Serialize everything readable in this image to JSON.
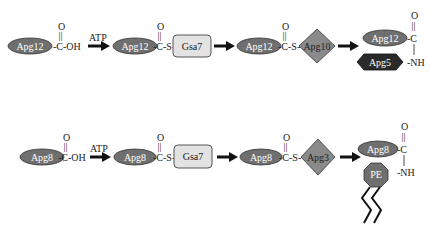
{
  "colors": {
    "ellipse_fill": "#6f6f6f",
    "diamond_fill": "#8a8a8a",
    "hexagon_fill": "#2a2a2a",
    "octagon_fill": "#6f6f6f",
    "box_fill": "#e3e3e3",
    "arrow": "#111111"
  },
  "rows": [
    {
      "protein": "Apg12",
      "carboxyl": "-C-OH",
      "carbonyl_o": "O",
      "double_bond": "||",
      "atp": "ATP",
      "thioester": "-C-S-",
      "e1": "Gsa7",
      "e2": "Apg10",
      "product_partner": "Apg5",
      "product_c": "-C",
      "product_nh": "-NH"
    },
    {
      "protein": "Apg8",
      "carboxyl": "-C-OH",
      "carbonyl_o": "O",
      "double_bond": "||",
      "atp": "ATP",
      "thioester": "-C-S-",
      "e1": "Gsa7",
      "e2": "Apg3",
      "product_partner": "PE",
      "product_c": "-C",
      "product_nh": "-NH"
    }
  ]
}
